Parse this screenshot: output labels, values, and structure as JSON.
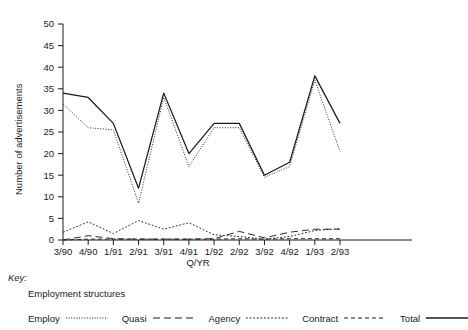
{
  "chart_data": {
    "type": "line",
    "title": "",
    "xlabel": "Q/YR",
    "ylabel": "Number of advertisements",
    "ylim": [
      0,
      50
    ],
    "yticks": [
      0,
      5,
      10,
      15,
      20,
      25,
      30,
      35,
      40,
      45,
      50
    ],
    "grid": false,
    "legend_position": "below-plot",
    "categories": [
      "3/90",
      "4/90",
      "1/91",
      "2/91",
      "3/91",
      "4/91",
      "1/92",
      "2/92",
      "3/92",
      "4/92",
      "1/93",
      "2/93"
    ],
    "series": [
      {
        "name": "Employ",
        "style": "fine-dotted",
        "color": "#2a2a2a",
        "values": [
          31.5,
          26.0,
          25.5,
          8.5,
          33.0,
          17.0,
          26.0,
          26.0,
          14.5,
          17.0,
          37.0,
          20.5
        ]
      },
      {
        "name": "Quasi",
        "style": "long-dashed",
        "color": "#2a2a2a",
        "values": [
          0.0,
          1.0,
          0.3,
          0.2,
          0.2,
          0.2,
          0.3,
          2.0,
          0.5,
          1.8,
          2.5,
          2.5
        ]
      },
      {
        "name": "Agency",
        "style": "dotted",
        "color": "#2a2a2a",
        "values": [
          1.8,
          4.2,
          1.5,
          4.5,
          2.5,
          4.0,
          1.2,
          0.8,
          0.2,
          0.8,
          2.2,
          2.6
        ]
      },
      {
        "name": "Contract",
        "style": "dash-dot",
        "color": "#2a2a2a",
        "values": [
          0.0,
          0.2,
          0.2,
          0.2,
          0.2,
          0.2,
          0.2,
          0.3,
          0.2,
          0.3,
          0.3,
          0.3
        ]
      },
      {
        "name": "Total",
        "style": "solid",
        "color": "#1a1a1a",
        "values": [
          34.0,
          33.0,
          27.0,
          12.0,
          34.0,
          20.0,
          27.0,
          27.0,
          15.0,
          18.0,
          38.0,
          27.0
        ]
      }
    ]
  },
  "key": {
    "heading": "Key:",
    "subheading": "Employment structures",
    "entries": [
      {
        "label": "Employ",
        "style": "fine-dotted"
      },
      {
        "label": "Quasi",
        "style": "long-dashed"
      },
      {
        "label": "Agency",
        "style": "dotted"
      },
      {
        "label": "Contract",
        "style": "dash-dot"
      },
      {
        "label": "Total",
        "style": "solid"
      }
    ]
  }
}
